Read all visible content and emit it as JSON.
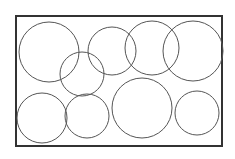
{
  "diagram": {
    "width": 235,
    "height": 159,
    "background": "#ffffff",
    "frame": {
      "x": 16,
      "y": 16,
      "width": 206,
      "height": 130,
      "stroke": "#333333",
      "stroke_width": 2
    },
    "circle_style": {
      "stroke": "#555555",
      "stroke_width": 1,
      "fill": "none"
    },
    "circles": [
      {
        "id": "circle-1",
        "cx": 49,
        "cy": 52,
        "r": 30
      },
      {
        "id": "circle-2",
        "cx": 82,
        "cy": 74,
        "r": 22
      },
      {
        "id": "circle-3",
        "cx": 112,
        "cy": 51,
        "r": 24
      },
      {
        "id": "circle-4",
        "cx": 152,
        "cy": 48,
        "r": 27
      },
      {
        "id": "circle-5",
        "cx": 193,
        "cy": 51,
        "r": 30
      },
      {
        "id": "circle-6",
        "cx": 42,
        "cy": 118,
        "r": 25
      },
      {
        "id": "circle-7",
        "cx": 87,
        "cy": 116,
        "r": 22
      },
      {
        "id": "circle-8",
        "cx": 142,
        "cy": 108,
        "r": 30
      },
      {
        "id": "circle-9",
        "cx": 197,
        "cy": 113,
        "r": 22
      }
    ]
  }
}
